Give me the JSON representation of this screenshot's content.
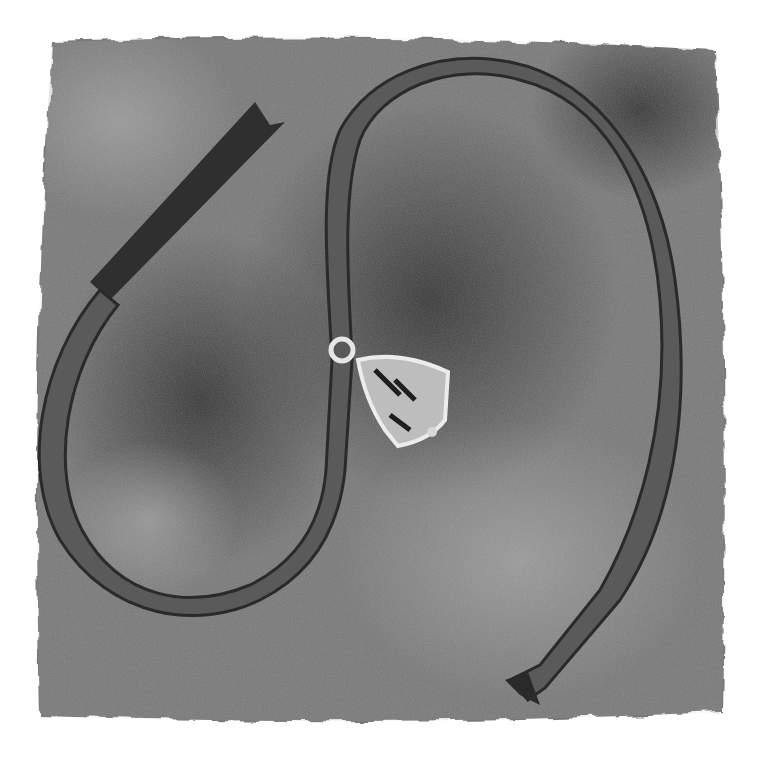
{
  "artwork": {
    "subject": "watercolor ribbon loop with small bell",
    "palette": {
      "paper": "#ffffff",
      "wash_light": "#8f8f8f",
      "wash_mid": "#6e6e6e",
      "wash_dark": "#3a3a3a",
      "ribbon_face": "#7c7c7c",
      "ribbon_shadow": "#2e2e2e",
      "bell_light": "#e8e8e8",
      "bell_dark": "#1e1e1e"
    },
    "elements": [
      "watercolor-square-wash",
      "ribbon",
      "bell"
    ]
  }
}
